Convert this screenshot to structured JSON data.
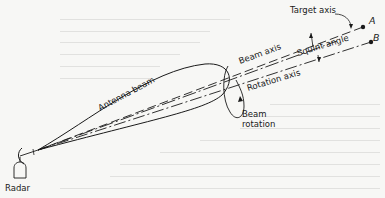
{
  "diagram": {
    "labels": {
      "target_axis": "Target axis",
      "point_a": "A",
      "point_b": "B",
      "beam_axis": "Beam axis",
      "squint_angle": "Squint angle",
      "rotation_axis": "Rotation axis",
      "antenna_beam": "Antenna beam",
      "beam_rotation_line1": "Beam",
      "beam_rotation_line2": "rotation",
      "radar": "Radar"
    },
    "colors": {
      "ink": "#1a1a1a",
      "paper": "#f7f7f5"
    }
  }
}
